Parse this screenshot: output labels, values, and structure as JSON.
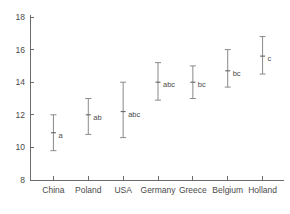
{
  "chart_data": {
    "type": "scatter",
    "title": "",
    "subtitle": "",
    "xlabel": "",
    "ylabel": "",
    "grid": false,
    "legend": "none",
    "categories": [
      "China",
      "Poland",
      "USA",
      "Germany",
      "Greece",
      "Belgium",
      "Holland"
    ],
    "values": [
      10.9,
      12.0,
      12.2,
      14.0,
      14.0,
      14.7,
      15.6
    ],
    "error_low": [
      9.8,
      10.8,
      10.6,
      12.9,
      13.0,
      13.7,
      14.5
    ],
    "error_high": [
      12.0,
      13.0,
      14.0,
      15.2,
      15.0,
      16.0,
      16.8
    ],
    "group_labels": [
      "a",
      "ab",
      "abc",
      "abc",
      "bc",
      "bc",
      "c"
    ],
    "ylim": [
      8,
      18
    ],
    "yticks": [
      8,
      10,
      12,
      14,
      16,
      18
    ],
    "ytick_labels": [
      "8",
      "10",
      "12",
      "14",
      "16",
      "18"
    ],
    "xtick_labels": [
      "China",
      "Poland",
      "USA",
      "Germany",
      "Greece",
      "Belgium",
      "Holland"
    ],
    "series": [
      {
        "name": "mean with error bars",
        "points": [
          {
            "category": "China",
            "mean": 10.9,
            "low": 9.8,
            "high": 12.0,
            "annotation": "a"
          },
          {
            "category": "Poland",
            "mean": 12.0,
            "low": 10.8,
            "high": 13.0,
            "annotation": "ab"
          },
          {
            "category": "USA",
            "mean": 12.2,
            "low": 10.6,
            "high": 14.0,
            "annotation": "abc"
          },
          {
            "category": "Germany",
            "mean": 14.0,
            "low": 12.9,
            "high": 15.2,
            "annotation": "abc"
          },
          {
            "category": "Greece",
            "mean": 14.0,
            "low": 13.0,
            "high": 15.0,
            "annotation": "bc"
          },
          {
            "category": "Belgium",
            "mean": 14.7,
            "low": 13.7,
            "high": 16.0,
            "annotation": "bc"
          },
          {
            "category": "Holland",
            "mean": 15.6,
            "low": 14.5,
            "high": 16.8,
            "annotation": "c"
          }
        ]
      }
    ],
    "colors": {
      "axis": "#6b6b6b",
      "error_bar": "#8a8a8a",
      "marker": "#6e6e6e",
      "text": "#4a4a4a",
      "background": "#ffffff"
    }
  }
}
